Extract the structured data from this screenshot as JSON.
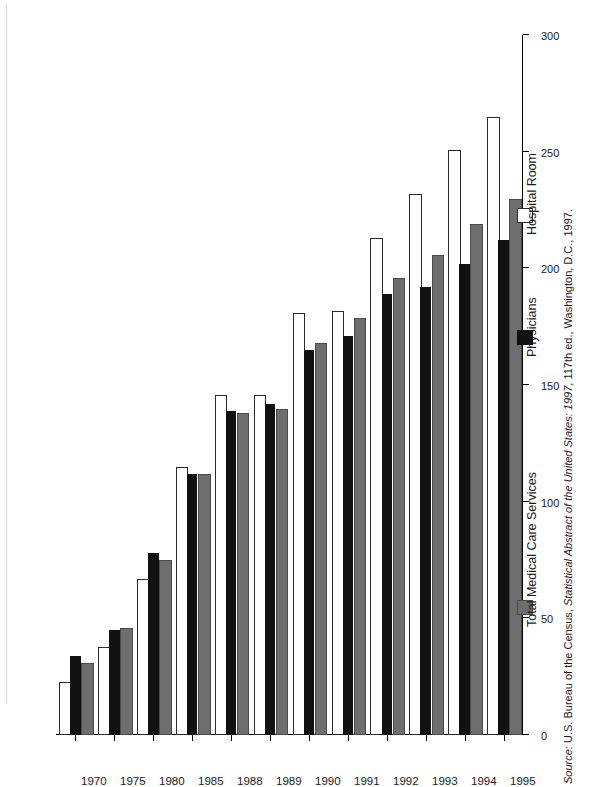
{
  "chart_data": {
    "type": "bar",
    "orientation": "horizontal",
    "title": "",
    "xlabel": "",
    "ylabel": "",
    "xlim": [
      0,
      300
    ],
    "axis_ticks": [
      "0",
      "50",
      "100",
      "150",
      "200",
      "250",
      "300"
    ],
    "grid": false,
    "legend_position": "right",
    "categories": [
      "1970",
      "1975",
      "1980",
      "1985",
      "1988",
      "1989",
      "1990",
      "1991",
      "1992",
      "1993",
      "1994",
      "1995"
    ],
    "series": [
      {
        "name": "Total Medical Care Services",
        "color": "#6e6e6e",
        "values": [
          30,
          45,
          74,
          111,
          137,
          139,
          167,
          178,
          195,
          205,
          218,
          229
        ]
      },
      {
        "name": "Physicians",
        "color": "#111111",
        "values": [
          34,
          45,
          78,
          112,
          139,
          142,
          165,
          171,
          189,
          192,
          202,
          212
        ]
      },
      {
        "name": "Hospital Room",
        "color": "#ffffff",
        "values": [
          22,
          37,
          66,
          114,
          145,
          145,
          180,
          181,
          212,
          231,
          250,
          264
        ]
      }
    ]
  },
  "legend": {
    "items": [
      {
        "label": "Hospital Room",
        "swatch": "hospital-room-swatch"
      },
      {
        "label": "Physicians",
        "swatch": "physicians-swatch"
      },
      {
        "label": "Total Medical Care Services",
        "swatch": "total-medical-care-services-swatch"
      }
    ]
  },
  "source": {
    "prefix": "Source:",
    "text": " U.S. Bureau of the Census, ",
    "title": "Statistical Abstract of the United States: 1997",
    "suffix": ", 117th ed., Washington, D.C., 1997."
  }
}
